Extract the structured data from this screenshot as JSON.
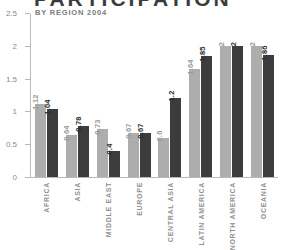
{
  "title": "PARTICIPATION",
  "subtitle": "BY REGION 2004",
  "colors": {
    "series_light": "#adadad",
    "series_dark": "#3c3c3c",
    "axis": "#b9b9b9",
    "tick_text": "#8a8a8a",
    "category_text": "#8f8f8f",
    "title_text": "#3b3b3b"
  },
  "chart_data": {
    "type": "bar",
    "title": "PARTICIPATION",
    "subtitle": "BY REGION 2004",
    "xlabel": "",
    "ylabel": "",
    "ylim": [
      0,
      2.5
    ],
    "yticks": [
      "0",
      "0.5",
      "1",
      "1.5",
      "2",
      "2.5"
    ],
    "ytick_values": [
      0,
      0.5,
      1,
      1.5,
      2,
      2.5
    ],
    "grid": false,
    "legend": "none",
    "categories": [
      "AFRICA",
      "ASIA",
      "MIDDLE EAST",
      "EUROPE",
      "CENTRAL ASIA",
      "LATIN AMERICA",
      "NORTH AMERICA",
      "OCEANIA"
    ],
    "series": [
      {
        "name": "series-1",
        "color": "#adadad",
        "values": [
          1.12,
          0.64,
          0.73,
          0.67,
          0.6,
          1.64,
          2,
          2
        ],
        "labels": [
          "1.12",
          "0.64",
          "0.73",
          "0.67",
          "0.6",
          "1.64",
          "2",
          "2"
        ]
      },
      {
        "name": "series-2",
        "color": "#3c3c3c",
        "values": [
          1.04,
          0.78,
          0.4,
          0.67,
          1.2,
          1.85,
          2,
          1.86
        ],
        "labels": [
          "1.04",
          "0.78",
          "0.4",
          "0.67",
          "1.2",
          "1.85",
          "2",
          "1.86"
        ]
      }
    ]
  }
}
